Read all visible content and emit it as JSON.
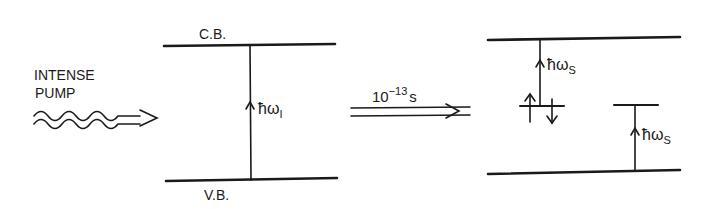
{
  "diagram": {
    "type": "energy-level-diagram",
    "pump": {
      "label_line1": "INTENSE",
      "label_line2": "PUMP"
    },
    "left_panel": {
      "upper_band": "C.B.",
      "lower_band": "V.B.",
      "transition_label": "ħω",
      "transition_subscript": "I"
    },
    "relaxation": {
      "time_base": "10",
      "time_exponent": "−13",
      "time_unit": "s"
    },
    "right_panel": {
      "transition_1_label": "ħω",
      "transition_1_subscript": "S",
      "transition_2_label": "ħω",
      "transition_2_subscript": "S"
    },
    "colors": {
      "ink": "#1a1a1a",
      "background": "#ffffff"
    }
  }
}
